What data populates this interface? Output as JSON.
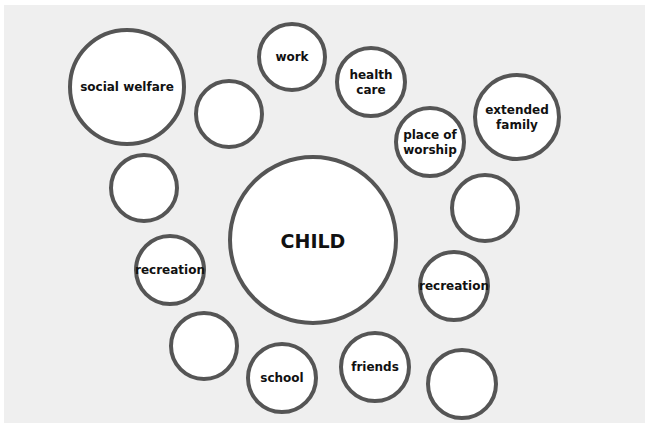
{
  "diagram": {
    "title": "",
    "center": {
      "label": "CHILD"
    },
    "nodes": [
      {
        "id": "social-welfare",
        "lines": [
          "social welfare"
        ]
      },
      {
        "id": "blank-1",
        "lines": []
      },
      {
        "id": "work",
        "lines": [
          "work"
        ]
      },
      {
        "id": "health-care",
        "lines": [
          "health",
          "care"
        ]
      },
      {
        "id": "place-of-worship",
        "lines": [
          "place of",
          "worship"
        ]
      },
      {
        "id": "extended-family",
        "lines": [
          "extended",
          "family"
        ]
      },
      {
        "id": "blank-2",
        "lines": []
      },
      {
        "id": "blank-3",
        "lines": []
      },
      {
        "id": "recreation-left",
        "lines": [
          "recreation"
        ]
      },
      {
        "id": "recreation-right",
        "lines": [
          "recreation"
        ]
      },
      {
        "id": "blank-4",
        "lines": []
      },
      {
        "id": "school",
        "lines": [
          "school"
        ]
      },
      {
        "id": "friends",
        "lines": [
          "friends"
        ]
      },
      {
        "id": "blank-5",
        "lines": []
      }
    ]
  },
  "colors": {
    "ring": "#555555",
    "fill": "#ffffff",
    "background": "#efefef",
    "text": "#111111"
  }
}
